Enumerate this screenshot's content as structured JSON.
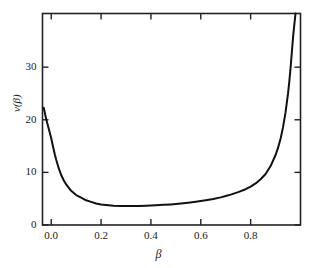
{
  "chart_data": {
    "type": "line",
    "title": "",
    "subtitle": "",
    "xlabel": "β",
    "ylabel": "v(β)",
    "xlim": [
      -0.035,
      1.0
    ],
    "ylim": [
      0,
      40.2
    ],
    "xticks": [
      0.0,
      0.2,
      0.4,
      0.6,
      0.8
    ],
    "xtick_labels": [
      "0.0",
      "0.2",
      "0.4",
      "0.6",
      "0.8"
    ],
    "yticks": [
      0,
      10,
      20,
      30
    ],
    "ytick_labels": [
      "0",
      "10",
      "20",
      "30"
    ],
    "grid": false,
    "legend": null,
    "annotations": [],
    "line_color": "#111111",
    "line_width": 2.0,
    "frame_color": "#222222",
    "background": "#ffffff",
    "series": [
      {
        "name": "v(β)",
        "x": [
          -0.03,
          -0.025,
          -0.02,
          -0.015,
          -0.01,
          -0.005,
          0.0,
          0.005,
          0.01,
          0.015,
          0.02,
          0.03,
          0.04,
          0.05,
          0.06,
          0.08,
          0.1,
          0.12,
          0.14,
          0.16,
          0.18,
          0.2,
          0.22,
          0.25,
          0.28,
          0.3,
          0.32,
          0.35,
          0.38,
          0.4,
          0.42,
          0.45,
          0.48,
          0.5,
          0.52,
          0.55,
          0.58,
          0.6,
          0.62,
          0.65,
          0.68,
          0.7,
          0.72,
          0.75,
          0.78,
          0.8,
          0.82,
          0.84,
          0.86,
          0.88,
          0.9,
          0.91,
          0.92,
          0.93,
          0.94,
          0.95,
          0.955,
          0.96,
          0.965,
          0.97,
          0.975,
          0.98
        ],
        "y": [
          22.3,
          21.2,
          20.1,
          19.2,
          18.3,
          17.4,
          16.5,
          15.4,
          14.3,
          13.3,
          12.4,
          10.8,
          9.5,
          8.5,
          7.7,
          6.5,
          5.7,
          5.2,
          4.7,
          4.4,
          4.1,
          3.9,
          3.8,
          3.65,
          3.6,
          3.6,
          3.6,
          3.62,
          3.66,
          3.7,
          3.75,
          3.83,
          3.92,
          4.0,
          4.1,
          4.25,
          4.42,
          4.55,
          4.7,
          4.95,
          5.25,
          5.5,
          5.78,
          6.25,
          6.8,
          7.3,
          7.9,
          8.7,
          9.7,
          11.2,
          13.3,
          14.7,
          16.4,
          18.6,
          21.4,
          25.0,
          27.2,
          29.8,
          32.7,
          35.6,
          38.0,
          40.2
        ]
      }
    ]
  },
  "axes": {
    "x_title": "β",
    "y_title": "v(β)",
    "x_tick_labels": [
      "0.0",
      "0.2",
      "0.4",
      "0.6",
      "0.8"
    ],
    "y_tick_labels": [
      "0",
      "10",
      "20",
      "30"
    ]
  }
}
